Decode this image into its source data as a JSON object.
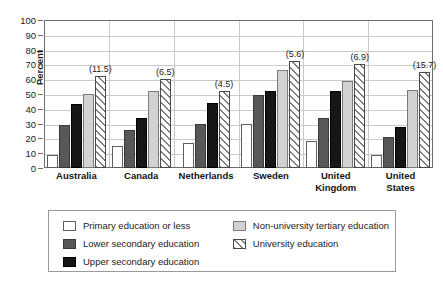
{
  "chart_data": {
    "type": "bar",
    "title": "",
    "xlabel": "",
    "ylabel": "Percent",
    "ylim": [
      0,
      100
    ],
    "ytick_step": 10,
    "yticks": [
      100,
      90,
      80,
      70,
      60,
      50,
      40,
      30,
      20,
      10,
      0
    ],
    "grid": true,
    "legend_position": "bottom",
    "categories": [
      "Australia",
      "Canada",
      "Netherlands",
      "Sweden",
      "United Kingdom",
      "United States"
    ],
    "series": [
      {
        "name": "Primary education or less",
        "key": "primary",
        "values": [
          9,
          15,
          17,
          30,
          18,
          9
        ]
      },
      {
        "name": "Lower secondary education",
        "key": "lower",
        "values": [
          29,
          26,
          30,
          49,
          34,
          21
        ]
      },
      {
        "name": "Upper secondary education",
        "key": "upper",
        "values": [
          43,
          34,
          44,
          52,
          52,
          28
        ]
      },
      {
        "name": "Non-university tertiary education",
        "key": "nonuni",
        "values": [
          50,
          52,
          null,
          66,
          59,
          53
        ]
      },
      {
        "name": "University education",
        "key": "uni",
        "values": [
          62,
          60,
          52,
          72,
          70,
          65
        ]
      }
    ],
    "annotations": [
      {
        "category": "Australia",
        "text": "(11.5)",
        "value": 11.5
      },
      {
        "category": "Canada",
        "text": "(6.5)",
        "value": 6.5
      },
      {
        "category": "Netherlands",
        "text": "(4.5)",
        "value": 4.5
      },
      {
        "category": "Sweden",
        "text": "(5.6)",
        "value": 5.6
      },
      {
        "category": "United Kingdom",
        "text": "(6.9)",
        "value": 6.9
      },
      {
        "category": "United States",
        "text": "(15.7)",
        "value": 15.7
      }
    ],
    "x_tick_labels": [
      [
        "Australia"
      ],
      [
        "Canada"
      ],
      [
        "Netherlands"
      ],
      [
        "Sweden"
      ],
      [
        "United",
        "Kingdom"
      ],
      [
        "United",
        "States"
      ]
    ]
  },
  "legend": {
    "columns": [
      [
        {
          "label": "Primary education or less",
          "swatch": "primary"
        },
        {
          "label": "Lower secondary education",
          "swatch": "lower"
        },
        {
          "label": "Upper secondary education",
          "swatch": "upper"
        }
      ],
      [
        {
          "label": "Non-university tertiary education",
          "swatch": "nonuni"
        },
        {
          "label": "University education",
          "swatch": "uni"
        }
      ]
    ]
  },
  "colors": {
    "primary": "#ffffff",
    "lower": "#585858",
    "upper": "#161616",
    "nonuni": "#d2d2d2",
    "uni_hatch": "#7d7d7d",
    "axis": "#6d6d6d",
    "grid": "#c9c9c9",
    "text": "#1b1b1b"
  }
}
